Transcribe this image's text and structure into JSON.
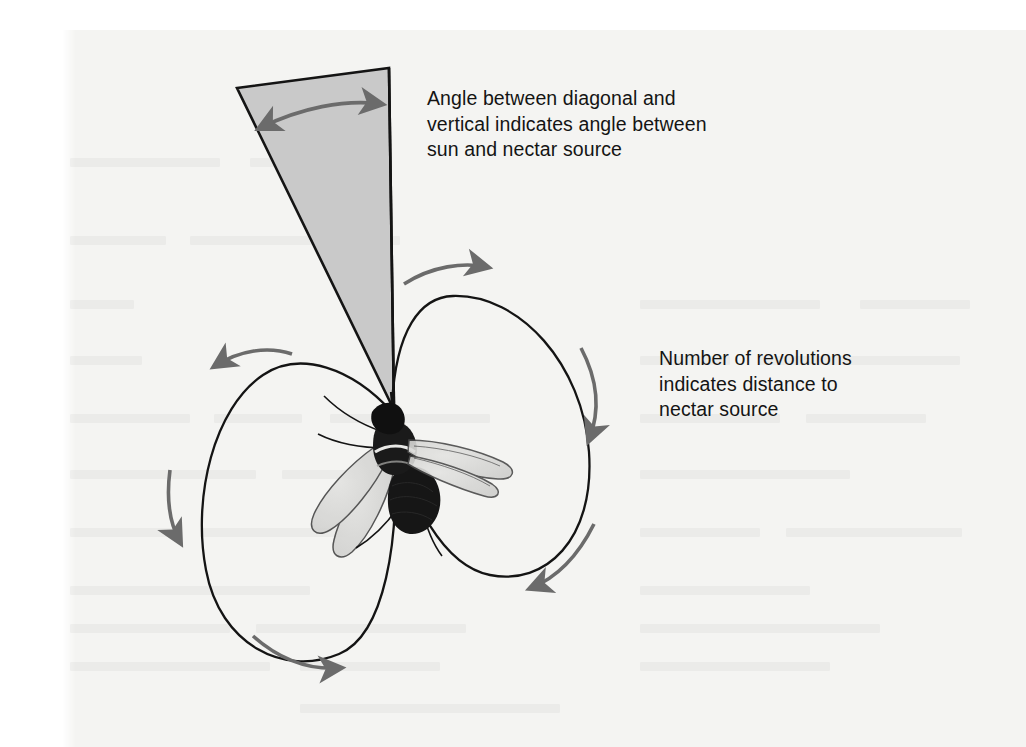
{
  "figure": {
    "background_color": "#ffffff",
    "sheet_color": "#f4f4f2",
    "ink_color": "#141414",
    "arrow_color": "#6b6b6b",
    "wedge_fill_color": "#c9c9c9",
    "wing_color": "#d8d8d6"
  },
  "captions": {
    "angle": "Angle between diagonal and\nvertical indicates angle between\nsun and nectar source",
    "revolutions": "Number of revolutions\nindicates distance to\nnectar source"
  },
  "elements": {
    "sun_wedge": "sun-direction-wedge",
    "angle_arrow": "angle-double-arrow",
    "vertical_line": "vertical-reference-line",
    "bee": "honeybee-illustration",
    "left_loop": "left-dance-loop",
    "right_loop": "right-dance-loop",
    "waggle_run": "waggle-run-segment"
  },
  "direction_arrows": [
    {
      "name": "right-loop-top-arrow",
      "points": "right"
    },
    {
      "name": "right-loop-side-arrow",
      "points": "down"
    },
    {
      "name": "right-loop-bottom-arrow",
      "points": "down-left"
    },
    {
      "name": "left-loop-top-arrow",
      "points": "left"
    },
    {
      "name": "left-loop-side-arrow",
      "points": "down"
    },
    {
      "name": "left-loop-bottom-arrow",
      "points": "right"
    }
  ]
}
